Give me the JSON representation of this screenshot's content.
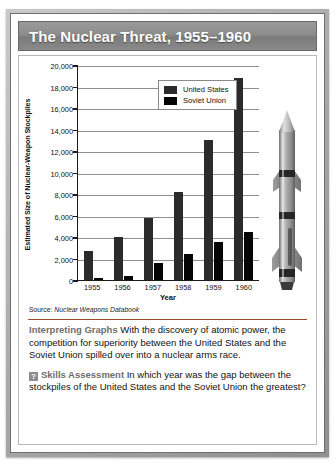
{
  "title": "The Nuclear Threat, 1955–1960",
  "source": {
    "lead": "Source: ",
    "publication": "Nuclear Weapons Databook"
  },
  "chart_data": {
    "type": "bar",
    "title": "The Nuclear Threat, 1955–1960",
    "xlabel": "Year",
    "ylabel": "Estimated Size of Nuclear-Weapon Stockpiles",
    "categories": [
      "1955",
      "1956",
      "1957",
      "1958",
      "1959",
      "1960"
    ],
    "yticks": [
      "0",
      "2,000",
      "4,000",
      "6,000",
      "8,000",
      "10,000",
      "12,000",
      "14,000",
      "16,000",
      "18,000",
      "20,000"
    ],
    "ylim": [
      0,
      20000
    ],
    "grid": true,
    "legend_position": "top-center",
    "series": [
      {
        "name": "United States",
        "color": "#2b2b2b",
        "values": [
          2700,
          4000,
          5800,
          8200,
          13000,
          18800
        ]
      },
      {
        "name": "Soviet Union",
        "color": "#050505",
        "values": [
          200,
          400,
          1600,
          2400,
          3500,
          4500
        ]
      }
    ]
  },
  "prose": {
    "interpreting_head": "Interpreting Graphs",
    "interpreting_body": "With the discovery of atomic power, the competition for superiority between the United States and the Soviet Union spilled over into a nuclear arms race.",
    "skills_badge": "?",
    "skills_head": "Skills Assessment",
    "skills_body": "In which year was the gap between the stockpiles of the United States and the Soviet Union the greatest?"
  }
}
